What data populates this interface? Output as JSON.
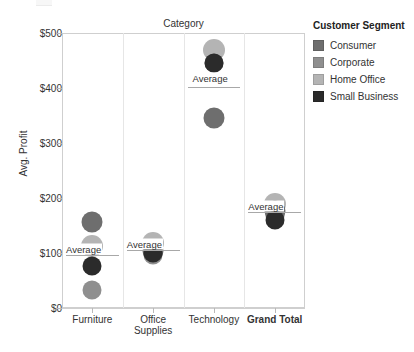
{
  "chart_data": {
    "type": "scatter",
    "title": "Category",
    "xlabel": "",
    "ylabel": "Avg. Profit",
    "ylim": [
      0,
      500
    ],
    "y_ticks": [
      "$0",
      "$100",
      "$200",
      "$300",
      "$400",
      "$500"
    ],
    "y_tick_values": [
      0,
      100,
      200,
      300,
      400,
      500
    ],
    "grid": false,
    "legend_position": "right",
    "legend_title": "Customer Segment",
    "categories": [
      "Furniture",
      "Office Supplies",
      "Technology",
      "Grand Total"
    ],
    "series": [
      {
        "name": "Consumer",
        "color": "#6e6e6e",
        "values": [
          157,
          104,
          345,
          176
        ]
      },
      {
        "name": "Corporate",
        "color": "#8f8f8f",
        "values": [
          33,
          96,
          445,
          168
        ]
      },
      {
        "name": "Home Office",
        "color": "#b4b4b4",
        "values": [
          113,
          118,
          470,
          190
        ]
      },
      {
        "name": "Small Business",
        "color": "#2b2b2b",
        "values": [
          76,
          100,
          445,
          160
        ]
      }
    ],
    "reference_lines": [
      {
        "category": "Furniture",
        "label": "Average",
        "value": 97
      },
      {
        "category": "Office Supplies",
        "label": "Average",
        "value": 106
      },
      {
        "category": "Technology",
        "label": "Average",
        "value": 401
      },
      {
        "category": "Grand Total",
        "label": "Average",
        "value": 175
      }
    ]
  },
  "legend": {
    "title": "Customer Segment",
    "items": [
      {
        "label": "Consumer",
        "color": "#6e6e6e"
      },
      {
        "label": "Corporate",
        "color": "#8f8f8f"
      },
      {
        "label": "Home Office",
        "color": "#b4b4b4"
      },
      {
        "label": "Small Business",
        "color": "#2b2b2b"
      }
    ]
  }
}
